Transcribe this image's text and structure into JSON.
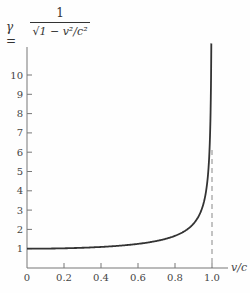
{
  "formula": {
    "lhs": "γ =",
    "numerator": "1",
    "denominator": "√1 − v²/c²"
  },
  "chart_data": {
    "type": "line",
    "xlabel": "v/c",
    "ylabel": "γ",
    "x_ticks": [
      "0",
      "0.2",
      "0.4",
      "0.6",
      "0.8",
      "1.0"
    ],
    "y_ticks": [
      "1",
      "2",
      "3",
      "4",
      "5",
      "6",
      "7",
      "8",
      "9",
      "10"
    ],
    "xlim": [
      0,
      1.05
    ],
    "ylim": [
      0,
      11.5
    ],
    "grid": false,
    "series": [
      {
        "name": "gamma",
        "x": [
          0,
          0.2,
          0.4,
          0.6,
          0.7,
          0.8,
          0.85,
          0.9,
          0.93,
          0.95,
          0.97,
          0.98,
          0.99,
          0.995,
          0.9963
        ],
        "values": [
          1.0,
          1.02,
          1.09,
          1.25,
          1.4,
          1.67,
          1.9,
          2.29,
          2.72,
          3.2,
          4.11,
          5.03,
          7.09,
          10.0,
          11.6
        ]
      }
    ],
    "annotations": [
      {
        "type": "vertical-dashed-line",
        "x": 1.0,
        "label": "asymptote at v/c = 1.0"
      }
    ]
  }
}
